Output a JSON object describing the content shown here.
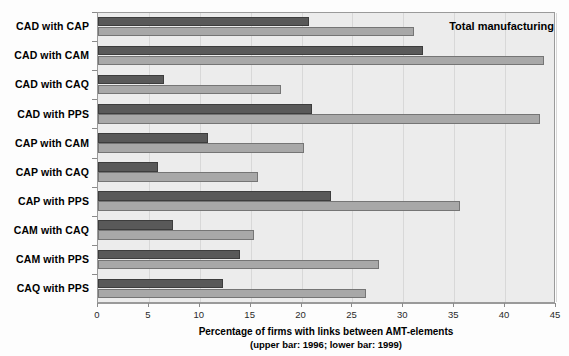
{
  "chart_data": {
    "type": "bar",
    "orientation": "horizontal",
    "title": "",
    "xlabel": "Percentage of firms with links between AMT-elements",
    "xlabel_sub": "(upper bar: 1996; lower bar: 1999)",
    "ylabel": "",
    "xlim": [
      0,
      45
    ],
    "xticks": [
      0,
      5,
      10,
      15,
      20,
      25,
      30,
      35,
      40,
      45
    ],
    "xticklabels": [
      "0",
      "5",
      "10",
      "15",
      "20",
      "25",
      "30",
      "35",
      "40",
      "45"
    ],
    "grid": true,
    "legend_position": "none",
    "annotations": [
      {
        "text": "Total manufacturing",
        "x": 34.5,
        "y_group": "CAD with CAP"
      }
    ],
    "categories": [
      "CAD with CAP",
      "CAD with CAM",
      "CAD with CAQ",
      "CAD with PPS",
      "CAP with CAM",
      "CAP with CAQ",
      "CAP with PPS",
      "CAM with CAQ",
      "CAM with PPS",
      "CAQ with PPS"
    ],
    "series": [
      {
        "name": "1996 (upper bar)",
        "color": "#595959",
        "values": [
          20.7,
          31.9,
          6.5,
          21.0,
          10.8,
          5.9,
          22.9,
          7.4,
          14.0,
          12.3
        ]
      },
      {
        "name": "1999 (lower bar)",
        "color": "#a8a8a8",
        "values": [
          31.0,
          43.8,
          18.0,
          43.4,
          20.2,
          15.7,
          35.6,
          15.3,
          27.6,
          26.3
        ]
      }
    ]
  },
  "figure": {
    "background_color": "#fdfdfd",
    "plot_background_color": "#ececec",
    "frame_color": "#9a9a9a"
  }
}
